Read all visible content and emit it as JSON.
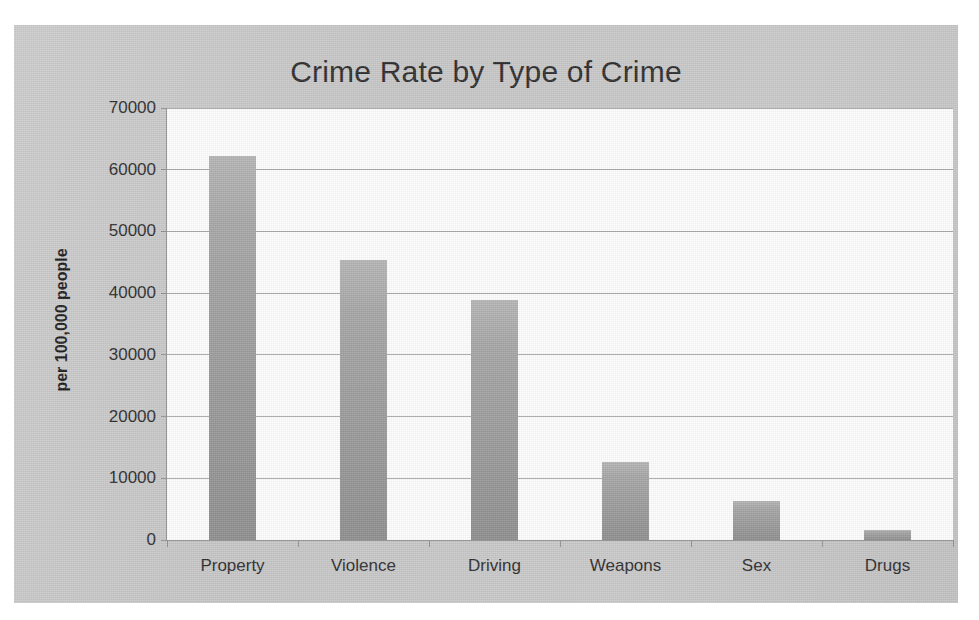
{
  "chart_data": {
    "type": "bar",
    "title": "Crime Rate by Type of Crime",
    "xlabel": "",
    "ylabel": "per 100,000 people",
    "categories": [
      "Property",
      "Violence",
      "Driving",
      "Weapons",
      "Sex",
      "Drugs"
    ],
    "values": [
      62200,
      45400,
      38900,
      12700,
      6400,
      1600
    ],
    "ylim": [
      0,
      70000
    ],
    "ytick_labels": [
      "0",
      "10000",
      "20000",
      "30000",
      "40000",
      "50000",
      "60000",
      "70000"
    ],
    "yticks": [
      0,
      10000,
      20000,
      30000,
      40000,
      50000,
      60000,
      70000
    ],
    "grid": true,
    "legend": false,
    "legend_position": "none",
    "series": [
      {
        "name": "Crime rate",
        "values": [
          62200,
          45400,
          38900,
          12700,
          6400,
          1600
        ]
      }
    ]
  },
  "colors": {
    "panel_background": "#c9c9c9",
    "plot_background": "#fdfdfd",
    "bar_top": "#b4b4b4",
    "bar_bottom": "#8e8e8e",
    "gridline": "#a8a8a8",
    "axis": "#8f8f8f",
    "text": "#2b2b2b"
  }
}
